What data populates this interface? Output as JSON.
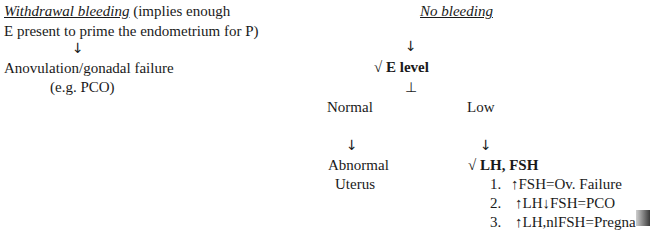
{
  "left": {
    "heading": "Withdrawal bleeding",
    "heading_rest": " (implies enough",
    "line2": "E present to prime the endometrium for P)",
    "arrow": "↓",
    "result": "Anovulation/gonadal failure",
    "example": "(e.g. PCO)"
  },
  "right": {
    "heading": "No bleeding",
    "arrow1": "↓",
    "test1": "√ E level",
    "branch_symbol": "⊥",
    "normal": "Normal",
    "low": "Low",
    "arrow_normal": "↓",
    "arrow_low": "↓",
    "abnormal_line1": "Abnormal",
    "abnormal_line2": "Uterus",
    "test2": "√ LH, FSH",
    "items": [
      {
        "num": "1.",
        "text": "↑FSH=Ov. Failure"
      },
      {
        "num": "2.",
        "text": "↑LH↓FSH=PCO"
      },
      {
        "num": "3.",
        "text": "↑LH,nlFSH=Pregna"
      }
    ]
  }
}
